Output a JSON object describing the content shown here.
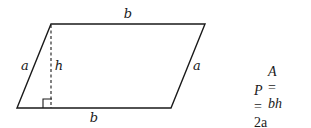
{
  "diagram": {
    "type": "parallelogram",
    "labels": {
      "top_base": "b",
      "bottom_base": "b",
      "left_side": "a",
      "right_side": "a",
      "height": "h"
    }
  },
  "formulas": {
    "area": {
      "lhs": "A",
      "eq": "=",
      "rhs": "bh"
    },
    "perimeter": {
      "lhs": "P",
      "eq": "=",
      "term1": "2a",
      "plus": "+",
      "term2": "2b"
    }
  }
}
